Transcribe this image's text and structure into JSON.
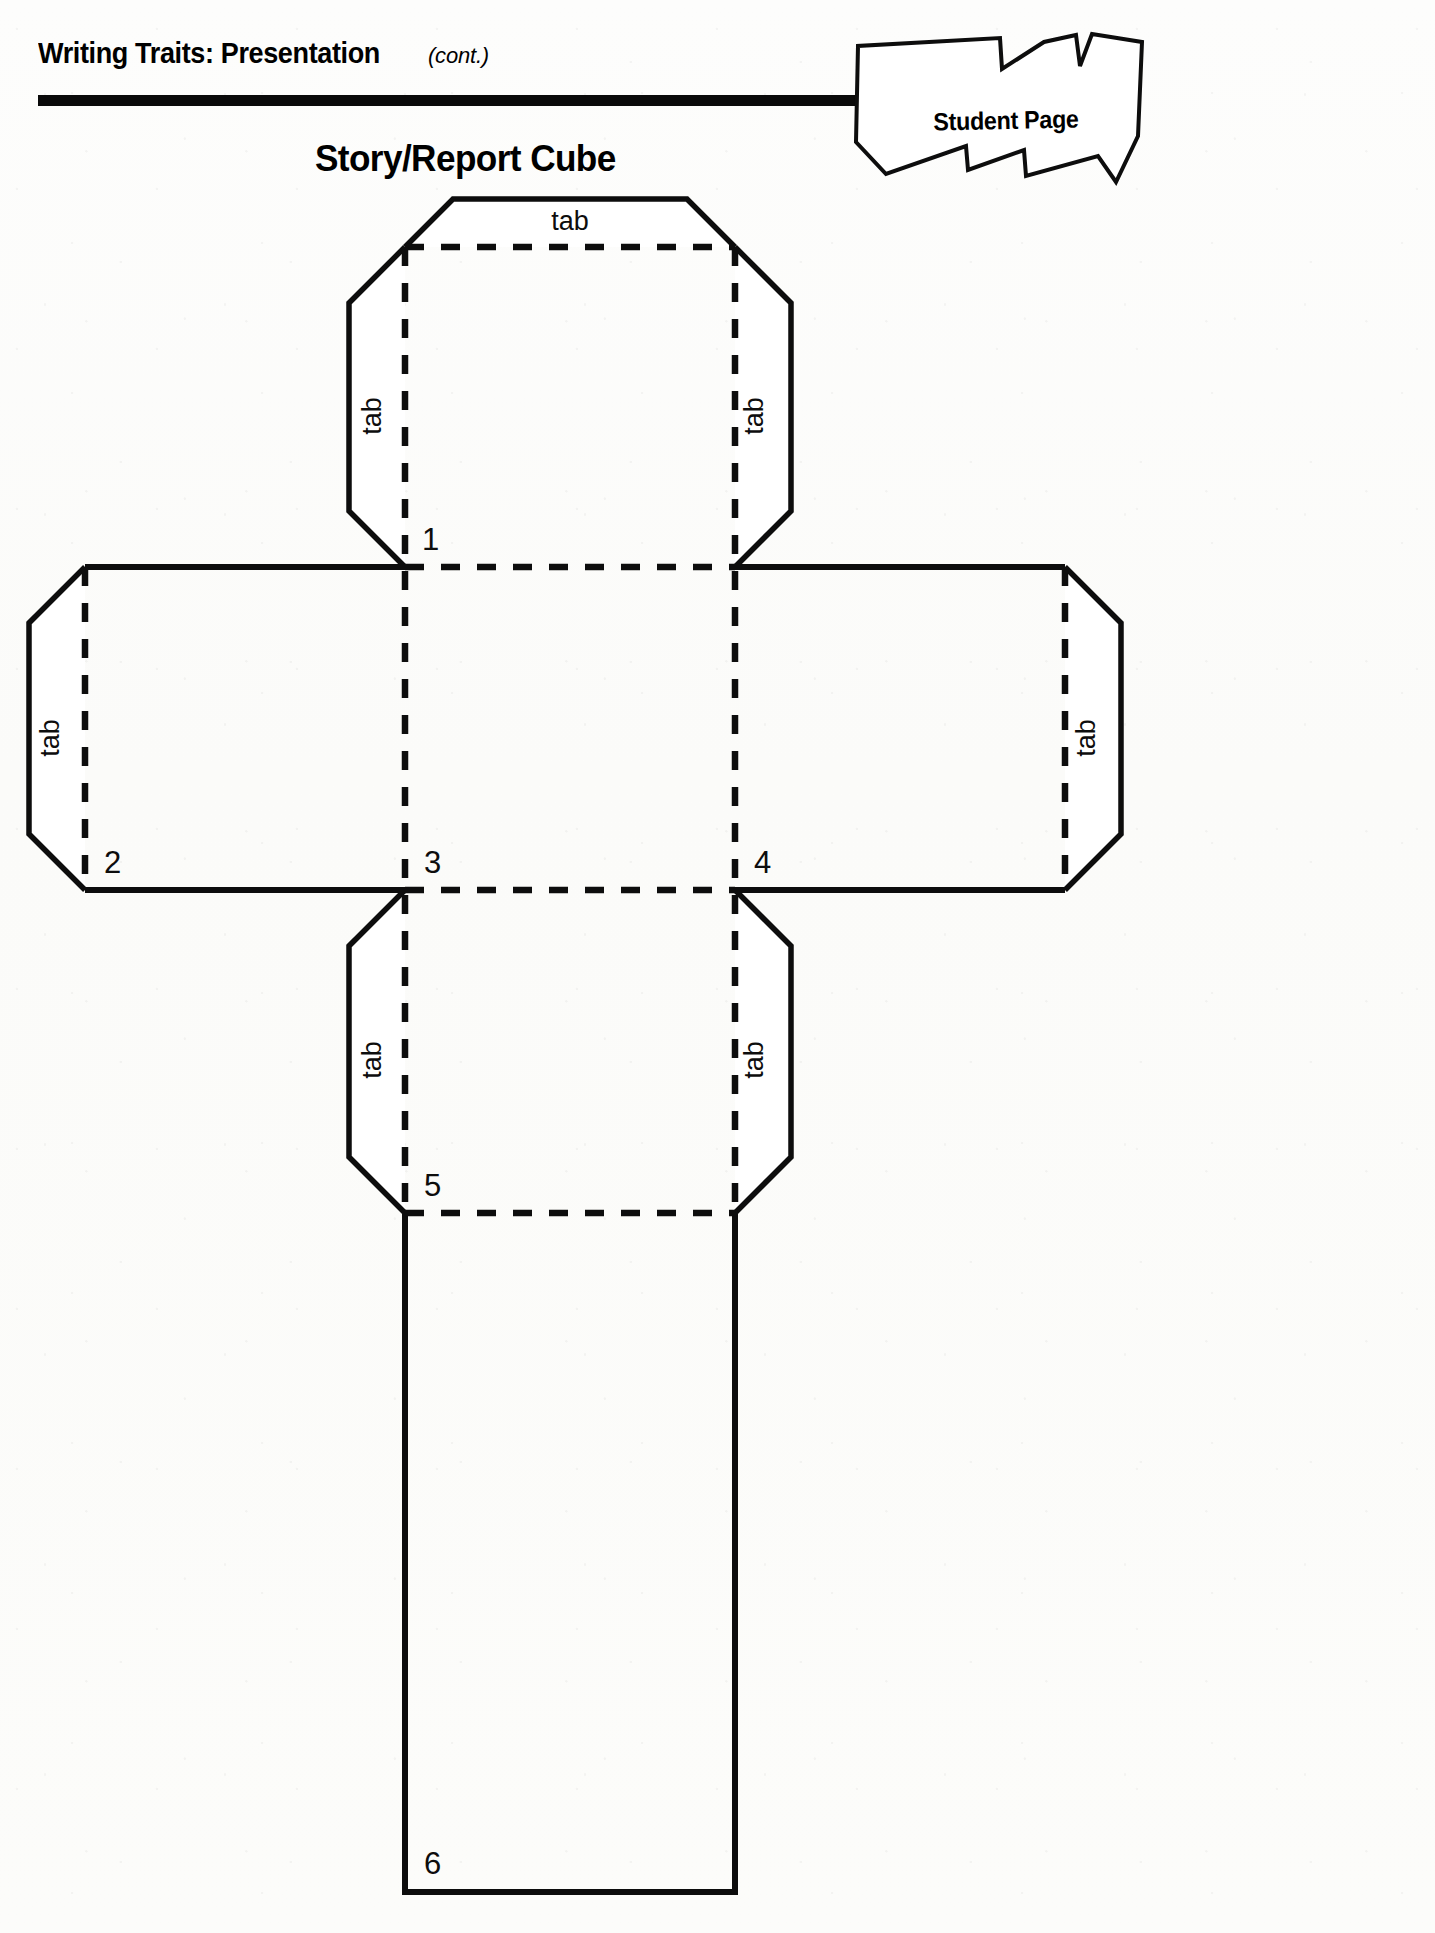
{
  "header": {
    "title": "Writing Traits: Presentation",
    "continued": "(cont.)",
    "badge_label": "Student Page"
  },
  "worksheet": {
    "title": "Story/Report Cube"
  },
  "diagram": {
    "type": "cube-net-template",
    "face_numbers": [
      "1",
      "2",
      "3",
      "4",
      "5",
      "6"
    ],
    "tab_label": "tab",
    "tabs": [
      {
        "id": "tab-top",
        "label": "tab",
        "orientation": "horizontal",
        "position": "top-of-face-1"
      },
      {
        "id": "tab-face1-left",
        "label": "tab",
        "orientation": "vertical",
        "position": "left-of-face-1"
      },
      {
        "id": "tab-face1-right",
        "label": "tab",
        "orientation": "vertical",
        "position": "right-of-face-1"
      },
      {
        "id": "tab-face2-left",
        "label": "tab",
        "orientation": "vertical",
        "position": "left-of-face-2"
      },
      {
        "id": "tab-face4-right",
        "label": "tab",
        "orientation": "vertical",
        "position": "right-of-face-4"
      },
      {
        "id": "tab-face5-left",
        "label": "tab",
        "orientation": "vertical",
        "position": "left-of-face-5"
      },
      {
        "id": "tab-face5-right",
        "label": "tab",
        "orientation": "vertical",
        "position": "right-of-face-5"
      }
    ],
    "colors": {
      "cut_line": "#0d0d0d",
      "fold_line": "#0d0d0d",
      "paper": "#ffffff"
    }
  }
}
